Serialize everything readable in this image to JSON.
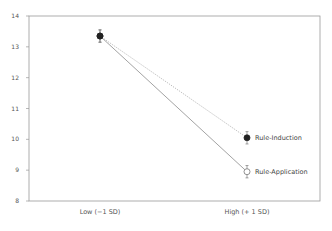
{
  "chart_data": {
    "type": "line",
    "title": "",
    "xlabel": "",
    "xlabel_partial": "(partially cut off at bottom edge)",
    "ylabel": "",
    "ylim": [
      8,
      14
    ],
    "yticks": [
      8,
      9,
      10,
      11,
      12,
      13,
      14
    ],
    "categories": [
      "Low (−1 SD)",
      "High (+ 1 SD)"
    ],
    "series": [
      {
        "name": "Rule-Induction",
        "values": [
          13.35,
          10.05
        ],
        "error": [
          0.2,
          0.2
        ],
        "marker": "filled-circle",
        "line_style": "dotted"
      },
      {
        "name": "Rule-Application",
        "values": [
          13.35,
          8.95
        ],
        "error": [
          0.2,
          0.2
        ],
        "marker": "open-circle",
        "line_style": "solid"
      }
    ],
    "grid": false,
    "legend_position": "inline-right-of-endpoints"
  },
  "colors": {
    "axis": "#888888",
    "line": "#999999",
    "marker": "#222222"
  }
}
